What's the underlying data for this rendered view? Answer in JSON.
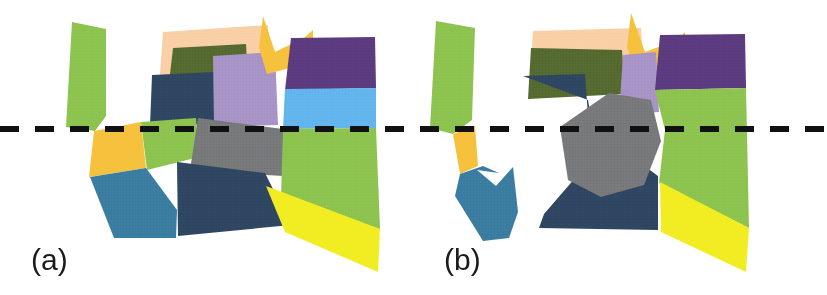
{
  "figure": {
    "width": 827,
    "height": 295,
    "background_color": "#ffffff"
  },
  "dashed_line": {
    "name": "horizontal-dashed-scanline",
    "color": "#111111",
    "y": 129,
    "thickness": 6,
    "dash_length": 19,
    "gap_length": 16,
    "x_start": 0,
    "x_end": 827
  },
  "palette": {
    "light_green": "#8CC34F",
    "peach": "#F9CFA6",
    "olive": "#54692F",
    "navy": "#2E4661",
    "light_purple": "#A793C6",
    "amber": "#F6C13C",
    "purple": "#5B3A7E",
    "sky_blue": "#62B4EC",
    "gray": "#77787A",
    "teal_blue": "#3A7CA0",
    "yellow": "#F2ED22",
    "white": "#ffffff"
  },
  "panels": [
    {
      "id": "a",
      "label": "(a)",
      "label_x": 31,
      "label_y": 245,
      "shapes": [
        {
          "name": "left-green-sliver",
          "color": "#8CC34F",
          "points": "72,22 106,29 106,116 95,131 66,127"
        },
        {
          "name": "peach-backdrop",
          "color": "#F9CFA6",
          "points": "163,32 268,25 272,96 158,101"
        },
        {
          "name": "olive-band",
          "color": "#54692F",
          "points": "173,48 246,44 249,95 167,100"
        },
        {
          "name": "navy-upper-left",
          "color": "#2E4661",
          "points": "152,75 216,72 218,124 150,126"
        },
        {
          "name": "light-purple-center",
          "color": "#A793C6",
          "points": "213,56 275,52 278,125 214,127"
        },
        {
          "name": "amber-top-peak",
          "color": "#F6C13C",
          "points": "263,16 275,52 304,38 313,30 313,62 267,74 259,48"
        },
        {
          "name": "purple-top-right",
          "color": "#5B3A7E",
          "points": "291,38 375,37 376,88 285,90"
        },
        {
          "name": "sky-blue-band",
          "color": "#62B4EC",
          "points": "285,89 376,88 376,128 283,129"
        },
        {
          "name": "amber-left-lower",
          "color": "#F6C13C",
          "points": "94,131 141,122 146,168 89,177"
        },
        {
          "name": "green-left-lower",
          "color": "#8CC34F",
          "points": "141,122 196,118 199,157 147,170"
        },
        {
          "name": "gray-center",
          "color": "#77787A",
          "points": "198,118 283,129 283,176 190,170"
        },
        {
          "name": "green-right-lower",
          "color": "#8CC34F",
          "points": "283,129 376,128 380,229 281,197"
        },
        {
          "name": "teal-left",
          "color": "#3A7CA0",
          "points": "90,177 146,168 177,210 176,238 114,238"
        },
        {
          "name": "navy-lower-center",
          "color": "#2E4661",
          "points": "177,162 265,173 291,225 178,236"
        },
        {
          "name": "yellow-bottom-right",
          "color": "#F2ED22",
          "points": "266,186 380,229 378,272 285,232"
        }
      ]
    },
    {
      "id": "b",
      "label": "(b)",
      "label_x": 31,
      "label_y": 245,
      "shapes": [
        {
          "name": "left-green-sliver",
          "color": "#8CC34F",
          "points": "23,21 62,28 59,120 40,134 17,128"
        },
        {
          "name": "peach-backdrop",
          "color": "#F9CFA6",
          "points": "120,31 228,28 232,90 116,96"
        },
        {
          "name": "olive-band",
          "color": "#54692F",
          "points": "118,48 209,50 212,94 115,99"
        },
        {
          "name": "amber-top-peak",
          "color": "#F6C13C",
          "points": "218,13 232,52 264,40 272,32 274,62 222,73 214,47"
        },
        {
          "name": "light-purple-center",
          "color": "#A793C6",
          "points": "210,55 243,52 246,112 206,115"
        },
        {
          "name": "purple-top-right",
          "color": "#5B3A7E",
          "points": "247,35 332,34 333,88 242,90"
        },
        {
          "name": "navy-main",
          "color": "#2E4661",
          "points": "110,76 172,74 176,130 163,177 131,214 126,228 245,230 245,176 180,128 175,100"
        },
        {
          "name": "amber-left-lower",
          "color": "#F6C13C",
          "points": "40,134 62,126 65,166 47,174"
        },
        {
          "name": "teal-left-notched",
          "color": "#3A7CA0",
          "points": "47,174 70,166 86,173 64,170 83,186 100,167 105,212 96,238 70,241 42,196"
        },
        {
          "name": "gray-heptagon",
          "color": "#77787A",
          "points": "196,93 238,100 248,141 231,185 188,197 155,180 147,127"
        },
        {
          "name": "green-right",
          "color": "#8CC34F",
          "points": "242,90 333,88 336,228 246,183 252,130"
        },
        {
          "name": "yellow-bottom-right",
          "color": "#F2ED22",
          "points": "247,182 336,228 333,272 248,232"
        }
      ]
    }
  ]
}
